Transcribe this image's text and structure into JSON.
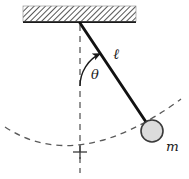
{
  "figure": {
    "width": 189,
    "height": 179,
    "background_color": "#ffffff"
  },
  "labels": {
    "length": "ℓ",
    "angle": "θ",
    "mass": "m"
  },
  "colors": {
    "line": "#1a1a1a",
    "dash": "#5a5a5a",
    "bob_fill": "#dcdcdc",
    "bob_stroke": "#3a3a3a",
    "hatch": "#4d4d4d",
    "ceiling_fill": "#ffffff"
  },
  "geometry": {
    "ceiling": {
      "x": 23,
      "y": 6,
      "width": 113,
      "height": 16
    },
    "pivot": {
      "x": 80,
      "y": 23
    },
    "bob": {
      "cx": 152,
      "cy": 131,
      "r": 11
    },
    "rod_label_pos": {
      "x": 113,
      "y": 58
    },
    "angle_label_pos": {
      "x": 92,
      "y": 78
    },
    "mass_label_pos": {
      "x": 167,
      "y": 150
    },
    "vertical_dash": {
      "x": 80,
      "y1": 25,
      "y2": 173
    },
    "center_cross": {
      "x": 80,
      "y": 152,
      "size": 7
    },
    "swing_arc": {
      "start_x": 5,
      "start_y": 127,
      "end_x": 181,
      "end_y": 99
    }
  }
}
